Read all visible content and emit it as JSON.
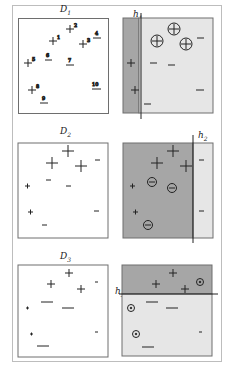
{
  "figure": {
    "panels": [
      {
        "id": "D1",
        "title": "D",
        "title_sub": "1",
        "points": [
          {
            "label": "1",
            "sign": "+",
            "x": 53,
            "y": 41
          },
          {
            "label": "2",
            "sign": "+",
            "x": 70,
            "y": 29
          },
          {
            "label": "3",
            "sign": "+",
            "x": 83,
            "y": 44
          },
          {
            "label": "4",
            "sign": "-",
            "x": 97,
            "y": 38
          },
          {
            "label": "5",
            "sign": "+",
            "x": 28,
            "y": 63
          },
          {
            "label": "6",
            "sign": "-",
            "x": 49,
            "y": 60
          },
          {
            "label": "7",
            "sign": "-",
            "x": 70,
            "y": 65
          },
          {
            "label": "8",
            "sign": "+",
            "x": 32,
            "y": 90
          },
          {
            "label": "9",
            "sign": "-",
            "x": 44,
            "y": 103
          },
          {
            "label": "10",
            "sign": "-",
            "x": 96,
            "y": 88
          }
        ]
      },
      {
        "id": "h1",
        "title": "h",
        "title_sub": "1",
        "orientation": "vertical",
        "misclassified": [
          "1",
          "2",
          "3"
        ],
        "colors": {
          "left": "#a6a6a6",
          "right": "#e6e6e6"
        }
      },
      {
        "id": "D2",
        "title": "D",
        "title_sub": "2"
      },
      {
        "id": "h2",
        "title": "h",
        "title_sub": "2",
        "orientation": "vertical",
        "misclassified": [
          "6",
          "7",
          "9"
        ],
        "colors": {
          "left": "#a6a6a6",
          "right": "#e6e6e6"
        }
      },
      {
        "id": "D3",
        "title": "D",
        "title_sub": "3"
      },
      {
        "id": "h3",
        "title": "h",
        "title_sub": "3",
        "orientation": "horizontal",
        "misclassified": [
          "4",
          "5",
          "8"
        ],
        "colors": {
          "top": "#a6a6a6",
          "bottom": "#e6e6e6"
        }
      }
    ]
  }
}
